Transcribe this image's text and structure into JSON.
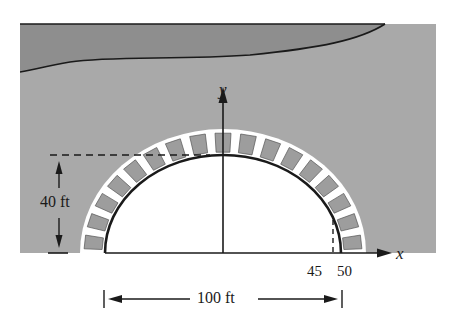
{
  "figure": {
    "type": "semi-elliptical arch bridge diagram",
    "axes": {
      "x_label": "x",
      "y_label": "y"
    },
    "dimensions": {
      "height_label": "40 ft",
      "width_label": "100 ft"
    },
    "tick_labels": {
      "t45": "45",
      "t50": "50"
    },
    "colors": {
      "panel": "#a9a9a9",
      "water": "#8f8f8f",
      "stone": "#9d9d9d",
      "ink": "#1a1a1a",
      "opening": "#ffffff"
    }
  }
}
